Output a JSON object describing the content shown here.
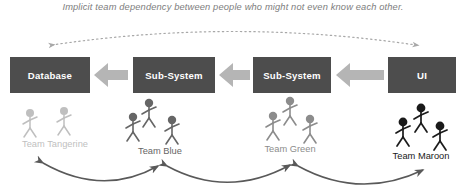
{
  "caption": {
    "text": "Implicit team dependency between people who might not even know each other."
  },
  "boxes": [
    {
      "label": "Database",
      "name": "box-database"
    },
    {
      "label": "Sub-System",
      "name": "box-subsystem-1"
    },
    {
      "label": "Sub-System",
      "name": "box-subsystem-2"
    },
    {
      "label": "UI",
      "name": "box-ui"
    }
  ],
  "teams": [
    {
      "label": "Team Tangerine",
      "people": 2,
      "shade": "#bfbfbf"
    },
    {
      "label": "Team Blue",
      "people": 3,
      "shade": "#666666"
    },
    {
      "label": "Team Green",
      "people": 3,
      "shade": "#8c8c8c"
    },
    {
      "label": "Team Maroon",
      "people": 3,
      "shade": "#1a1a1a"
    }
  ],
  "flow_arrows": [
    {
      "name": "flow-arrow-ui-to-subsystem2",
      "direction": "left"
    },
    {
      "name": "flow-arrow-subsystem2-to-subsystem1",
      "direction": "left"
    },
    {
      "name": "flow-arrow-subsystem1-to-database",
      "direction": "left"
    }
  ],
  "dependency_arc": {
    "name": "implicit-dependency-arc",
    "style": "dotted",
    "ends": "double"
  },
  "team_links": [
    {
      "name": "team-link-tangerine-blue",
      "ends": "double"
    },
    {
      "name": "team-link-blue-green",
      "ends": "double"
    },
    {
      "name": "team-link-green-maroon",
      "ends": "double"
    }
  ],
  "colors": {
    "box_fill": "#4d4d4d",
    "box_text": "#ffffff",
    "flow_arrow": "#b5b5b5",
    "caption_text": "#7d7d7d",
    "curve_stroke": "#595959",
    "dotted_stroke": "#a8a8a8"
  }
}
